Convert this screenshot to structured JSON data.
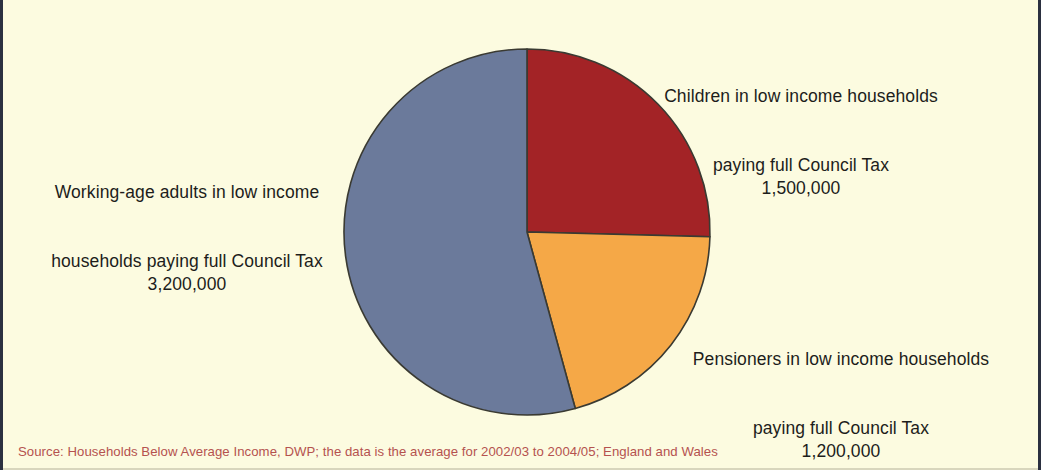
{
  "figure": {
    "background_color": "#fcfbe0",
    "border_color": "#2b3040",
    "source_note": "Source: Households Below Average Income, DWP; the data is the average for 2002/03 to 2004/05; England and Wales",
    "source_note_color": "#b5524f"
  },
  "labels": {
    "children": {
      "line1": "Children in low income households",
      "line2": "paying full Council Tax",
      "value": "1,500,000"
    },
    "working_age": {
      "line1": "Working-age adults in low income",
      "line2": "households paying full Council Tax",
      "value": "3,200,000"
    },
    "pensioners": {
      "line1": "Pensioners in low income households",
      "line2": "paying full Council Tax",
      "value": "1,200,000"
    }
  },
  "chart_data": {
    "type": "pie",
    "title": "",
    "subtitle": "",
    "xlabel": "",
    "ylabel": "",
    "grid": false,
    "legend_position": "callout-labels",
    "total": 5900000,
    "units": "people",
    "start_angle_deg": 0,
    "direction": "clockwise",
    "center": {
      "x": 524,
      "y": 232
    },
    "radius": 183,
    "slice_outline_color": "#3a3a32",
    "categories": [
      "Children in low income households paying full Council Tax",
      "Pensioners in low income households paying full Council Tax",
      "Working-age adults in low income households paying full Council Tax"
    ],
    "values": [
      1500000,
      1200000,
      3200000
    ],
    "value_labels": [
      "1,500,000",
      "1,200,000",
      "3,200,000"
    ],
    "colors": [
      "#a32326",
      "#f5a847",
      "#6b7a9b"
    ],
    "slices": [
      {
        "name": "Children in low income households paying full Council Tax",
        "short_name": "Children",
        "value": 1500000,
        "value_label": "1,500,000",
        "percent": 25.4,
        "color": "#a32326",
        "start_angle_deg": 0,
        "end_angle_deg": 91.5
      },
      {
        "name": "Pensioners in low income households paying full Council Tax",
        "short_name": "Pensioners",
        "value": 1200000,
        "value_label": "1,200,000",
        "percent": 20.3,
        "color": "#f5a847",
        "start_angle_deg": 91.5,
        "end_angle_deg": 164.7
      },
      {
        "name": "Working-age adults in low income households paying full Council Tax",
        "short_name": "Working-age adults",
        "value": 3200000,
        "value_label": "3,200,000",
        "percent": 54.2,
        "color": "#6b7a9b",
        "start_angle_deg": 164.7,
        "end_angle_deg": 360
      }
    ]
  }
}
